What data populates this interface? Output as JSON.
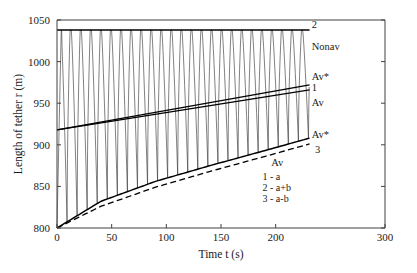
{
  "chart_data": {
    "type": "line",
    "title": "",
    "xlabel": "Time t  (s)",
    "ylabel": "Length of tether r (m)",
    "xlim": [
      0,
      300
    ],
    "ylim": [
      800,
      1050
    ],
    "xticks": [
      0,
      50,
      100,
      150,
      200,
      300
    ],
    "xticklabels": [
      "0",
      "50",
      "100",
      "150",
      "200",
      "300"
    ],
    "yticks": [
      800,
      850,
      900,
      950,
      1000,
      1050
    ],
    "yticklabels": [
      "800",
      "850",
      "900",
      "950",
      "1000",
      "1050"
    ],
    "grid": false,
    "legend_position": "inside-lower-right",
    "data_x_end": 231,
    "series": [
      {
        "name": "oscillation",
        "style": "solid-thin",
        "description": "Sawtooth-like librating tether length oscillation between lower envelope a-b and upper envelope a+b",
        "period_s": 9.2,
        "peak_value": 1038,
        "start_value": 800,
        "n_cycles": 25
      },
      {
        "name": "2 - a+b",
        "label": "2",
        "style": "solid",
        "x": [
          0,
          231
        ],
        "y": [
          1038,
          1038
        ]
      },
      {
        "name": "1 - a (Av*)",
        "label": "Av*",
        "style": "solid",
        "x": [
          0,
          231
        ],
        "y": [
          918,
          972
        ]
      },
      {
        "name": "1 - a (Av)",
        "label": "Av",
        "style": "solid",
        "x": [
          0,
          231
        ],
        "y": [
          918,
          966
        ]
      },
      {
        "name": "3 - a-b (Av*)",
        "label": "Av*",
        "style": "solid",
        "x": [
          0,
          40,
          90,
          140,
          190,
          231
        ],
        "y": [
          800,
          832,
          856,
          875,
          893,
          908
        ]
      },
      {
        "name": "3 - a-b (Av)",
        "label": "Av",
        "style": "dashed",
        "x": [
          0,
          40,
          90,
          140,
          190,
          231
        ],
        "y": [
          800,
          826,
          849,
          868,
          886,
          901
        ]
      }
    ],
    "annotations": [
      {
        "name": "label-2",
        "text": "2",
        "x": 233,
        "y": 1044
      },
      {
        "name": "label-nonav-top",
        "text": "Nonav",
        "x": 233,
        "y": 1018
      },
      {
        "name": "label-avstar-mid",
        "text": "Av*",
        "x": 233,
        "y": 982
      },
      {
        "name": "label-1",
        "text": "1",
        "x": 233,
        "y": 968
      },
      {
        "name": "label-av-mid",
        "text": "Av",
        "x": 233,
        "y": 950
      },
      {
        "name": "label-avstar-low",
        "text": "Av*",
        "x": 233,
        "y": 912
      },
      {
        "name": "label-3",
        "text": "3",
        "x": 236,
        "y": 894
      },
      {
        "name": "label-av-low",
        "text": "Av",
        "x": 196,
        "y": 878
      }
    ],
    "legend_entries": [
      {
        "key": "1",
        "value": "1 - a"
      },
      {
        "key": "2",
        "value": "2 - a+b"
      },
      {
        "key": "3",
        "value": "3 - a-b"
      }
    ]
  }
}
